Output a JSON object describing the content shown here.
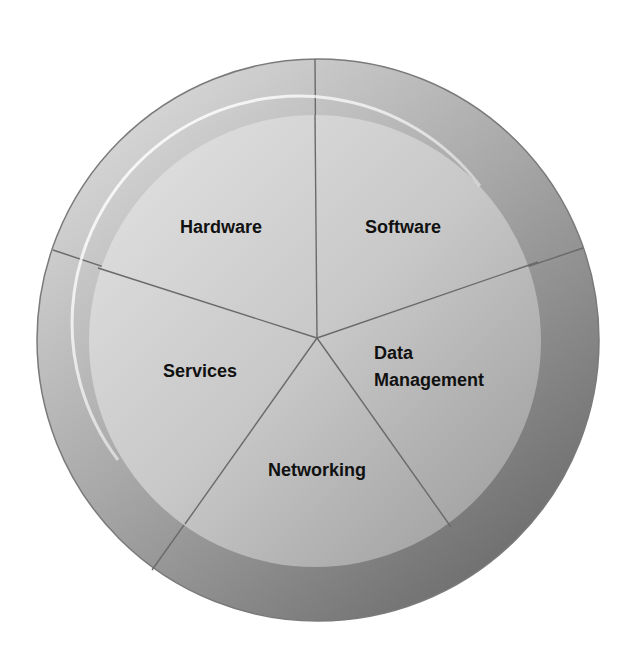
{
  "diagram": {
    "type": "segmented-circle",
    "segments": [
      {
        "id": "hardware",
        "label": "Hardware"
      },
      {
        "id": "software",
        "label": "Software"
      },
      {
        "id": "data-management",
        "label_lines": [
          "Data",
          "Management"
        ]
      },
      {
        "id": "networking",
        "label": "Networking"
      },
      {
        "id": "services",
        "label": "Services"
      }
    ],
    "colors": {
      "outer_ring_light": "#d2d2d2",
      "outer_ring_dark": "#6e6e6e",
      "inner_disc_light": "#dcdcdc",
      "inner_disc_dark": "#a4a4a4",
      "divider": "#6a6a6a",
      "outline": "#7a7a7a",
      "highlight": "#ffffff",
      "text": "#111111"
    }
  }
}
